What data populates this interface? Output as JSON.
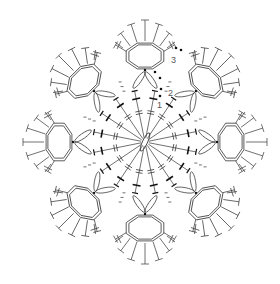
{
  "diagram": {
    "type": "crochet-chart",
    "center": [
      145,
      142
    ],
    "colors": {
      "stroke": "#333333",
      "inner": "#111111",
      "label": "#555555",
      "background": "#ffffff"
    },
    "round_labels": [
      {
        "text": "1",
        "x": 159,
        "y": 107
      },
      {
        "text": "2",
        "x": 170,
        "y": 93
      },
      {
        "text": "3",
        "x": 172,
        "y": 56
      }
    ],
    "petals": [
      {
        "name": "top",
        "angle": -90
      },
      {
        "name": "upper-right",
        "angle": -45
      },
      {
        "name": "right",
        "angle": 0
      },
      {
        "name": "lower-right",
        "angle": 45
      },
      {
        "name": "bottom",
        "angle": 90
      },
      {
        "name": "lower-left",
        "angle": 135
      },
      {
        "name": "left",
        "angle": 180
      },
      {
        "name": "upper-left",
        "angle": 225
      }
    ],
    "inner_spokes": 16
  }
}
